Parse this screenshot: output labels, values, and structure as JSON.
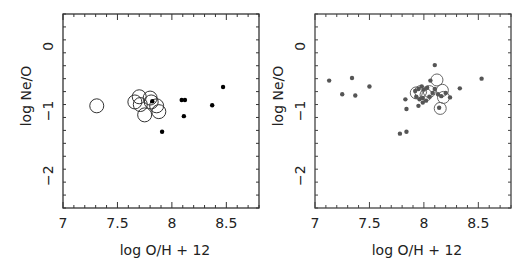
{
  "chart_data": [
    {
      "type": "scatter",
      "title": "",
      "xlabel": "log O/H + 12",
      "ylabel": "log Ne/O",
      "xlim": [
        7.0,
        8.8
      ],
      "ylim": [
        -2.5,
        0.5
      ],
      "xticks": [
        "7",
        "7.5",
        "8",
        "8.5"
      ],
      "yticks": [
        "0",
        "−1",
        "−2"
      ],
      "grid": false,
      "series": [
        {
          "name": "open circles",
          "marker": "open-circle",
          "points": [
            {
              "x": 7.31,
              "y": -0.92,
              "r": 7
            },
            {
              "x": 7.66,
              "y": -0.86,
              "r": 7
            },
            {
              "x": 7.7,
              "y": -0.78,
              "r": 7
            },
            {
              "x": 7.71,
              "y": -0.9,
              "r": 7
            },
            {
              "x": 7.75,
              "y": -1.06,
              "r": 7
            },
            {
              "x": 7.8,
              "y": -0.8,
              "r": 7
            },
            {
              "x": 7.81,
              "y": -0.86,
              "r": 7
            },
            {
              "x": 7.86,
              "y": -0.92,
              "r": 7
            },
            {
              "x": 7.88,
              "y": -1.01,
              "r": 7
            }
          ]
        },
        {
          "name": "filled dots",
          "marker": "filled-dot",
          "points": [
            {
              "x": 7.82,
              "y": -0.85
            },
            {
              "x": 7.91,
              "y": -1.32
            },
            {
              "x": 8.09,
              "y": -0.83
            },
            {
              "x": 8.12,
              "y": -0.83
            },
            {
              "x": 8.11,
              "y": -1.08
            },
            {
              "x": 8.37,
              "y": -0.91
            },
            {
              "x": 8.47,
              "y": -0.63
            }
          ]
        }
      ]
    },
    {
      "type": "scatter",
      "title": "",
      "xlabel": "log O/H + 12",
      "ylabel": "log Ne/O",
      "xlim": [
        7.0,
        8.8
      ],
      "ylim": [
        -2.5,
        0.5
      ],
      "xticks": [
        "7",
        "7.5",
        "8",
        "8.5"
      ],
      "yticks": [
        "0",
        "−1",
        "−2"
      ],
      "grid": false,
      "series": [
        {
          "name": "open circles",
          "marker": "open-circle",
          "points": [
            {
              "x": 7.93,
              "y": -0.72,
              "r": 6
            },
            {
              "x": 7.97,
              "y": -0.7,
              "r": 6
            },
            {
              "x": 8.02,
              "y": -0.75,
              "r": 6
            },
            {
              "x": 8.05,
              "y": -0.7,
              "r": 6
            },
            {
              "x": 8.12,
              "y": -0.52,
              "r": 6
            },
            {
              "x": 8.17,
              "y": -0.68,
              "r": 6
            },
            {
              "x": 8.18,
              "y": -0.79,
              "r": 6
            },
            {
              "x": 8.15,
              "y": -0.96,
              "r": 6
            }
          ]
        },
        {
          "name": "filled dots",
          "marker": "filled-dot",
          "points": [
            {
              "x": 7.13,
              "y": -0.53
            },
            {
              "x": 7.25,
              "y": -0.74
            },
            {
              "x": 7.34,
              "y": -0.49
            },
            {
              "x": 7.37,
              "y": -0.76
            },
            {
              "x": 7.5,
              "y": -0.62
            },
            {
              "x": 7.78,
              "y": -1.35
            },
            {
              "x": 7.84,
              "y": -1.32
            },
            {
              "x": 7.83,
              "y": -0.82
            },
            {
              "x": 7.84,
              "y": -0.97
            },
            {
              "x": 8.1,
              "y": -0.29
            },
            {
              "x": 8.06,
              "y": -0.53
            },
            {
              "x": 7.92,
              "y": -0.69
            },
            {
              "x": 7.95,
              "y": -0.66
            },
            {
              "x": 7.98,
              "y": -0.62
            },
            {
              "x": 8.0,
              "y": -0.67
            },
            {
              "x": 8.03,
              "y": -0.64
            },
            {
              "x": 7.93,
              "y": -0.78
            },
            {
              "x": 7.96,
              "y": -0.82
            },
            {
              "x": 7.99,
              "y": -0.8
            },
            {
              "x": 8.02,
              "y": -0.84
            },
            {
              "x": 7.95,
              "y": -0.92
            },
            {
              "x": 7.99,
              "y": -0.87
            },
            {
              "x": 8.05,
              "y": -0.78
            },
            {
              "x": 8.08,
              "y": -0.72
            },
            {
              "x": 8.1,
              "y": -0.66
            },
            {
              "x": 8.13,
              "y": -0.74
            },
            {
              "x": 8.16,
              "y": -0.77
            },
            {
              "x": 8.2,
              "y": -0.72
            },
            {
              "x": 8.14,
              "y": -0.95
            },
            {
              "x": 8.24,
              "y": -0.79
            },
            {
              "x": 8.33,
              "y": -0.65
            },
            {
              "x": 8.53,
              "y": -0.5
            }
          ]
        }
      ]
    }
  ],
  "panels": [
    {
      "xlabel": "log O/H + 12",
      "ylabel": "log Ne/O"
    },
    {
      "xlabel": "log O/H + 12",
      "ylabel": "log Ne/O"
    }
  ]
}
